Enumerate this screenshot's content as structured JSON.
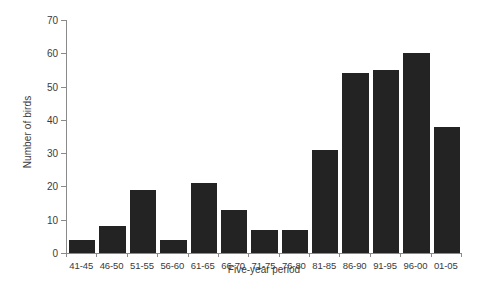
{
  "chart_data": {
    "type": "bar",
    "title": "",
    "xlabel": "Five-year period",
    "ylabel": "Number of birds",
    "categories": [
      "41-45",
      "46-50",
      "51-55",
      "56-60",
      "61-65",
      "66-70",
      "71-75",
      "76-80",
      "81-85",
      "86-90",
      "91-95",
      "96-00",
      "01-05"
    ],
    "values": [
      4,
      8,
      19,
      4,
      21,
      13,
      7,
      7,
      31,
      54,
      55,
      60,
      38
    ],
    "ylim": [
      0,
      70
    ],
    "yticks": [
      0,
      10,
      20,
      30,
      40,
      50,
      60,
      70
    ],
    "ytick_labels": [
      "0",
      "10",
      "20",
      "30",
      "40",
      "50",
      "60",
      "70"
    ],
    "grid": false,
    "legend": null,
    "bar_color": "#232323",
    "axis_color": "#8a8a8a",
    "text_color": "#3a3a3a",
    "background": "#ffffff"
  }
}
